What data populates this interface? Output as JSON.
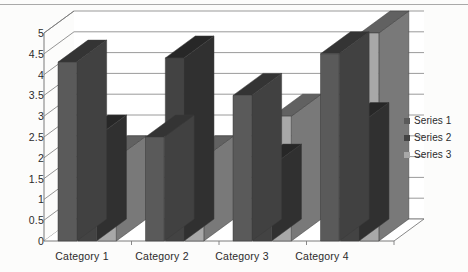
{
  "chart_data": {
    "type": "bar",
    "title": "",
    "subtitle": "",
    "xlabel": "",
    "ylabel": "",
    "categories": [
      "Category 1",
      "Category 2",
      "Category 3",
      "Category 4"
    ],
    "series": [
      {
        "name": "Series 1",
        "values": [
          4.3,
          2.5,
          3.5,
          4.5
        ],
        "color": "#5a5a5a"
      },
      {
        "name": "Series 2",
        "values": [
          2.5,
          4.4,
          1.8,
          2.8
        ],
        "color": "#434343"
      },
      {
        "name": "Series 3",
        "values": [
          2.0,
          2.0,
          3.0,
          5.0
        ],
        "color": "#a8a8a8"
      }
    ],
    "ylim": [
      0,
      5
    ],
    "ystep": 0.5,
    "yticks": [
      "0",
      "0.5",
      "1",
      "1.5",
      "2",
      "2.5",
      "3",
      "3.5",
      "4",
      "4.5",
      "5"
    ],
    "grid": true,
    "grid_axis": "y",
    "legend_position": "right",
    "style": "3d-clustered-column",
    "plot_background": "#ffffff",
    "grid_color": "#808080",
    "axis_color": "#7a7a7a"
  },
  "legend": {
    "entries": [
      {
        "marker": "legend-swatch-series-1",
        "label": "Series 1"
      },
      {
        "marker": "legend-swatch-series-2",
        "label": "Series 2"
      },
      {
        "marker": "legend-swatch-series-3",
        "label": "Series 3"
      }
    ]
  },
  "yaxis": {
    "labels": [
      "5",
      "4.5",
      "4",
      "3.5",
      "3",
      "2.5",
      "2",
      "1.5",
      "1",
      "0.5",
      "0"
    ]
  },
  "xaxis": {
    "labels": [
      "Category 1",
      "Category 2",
      "Category 3",
      "Category 4"
    ]
  }
}
